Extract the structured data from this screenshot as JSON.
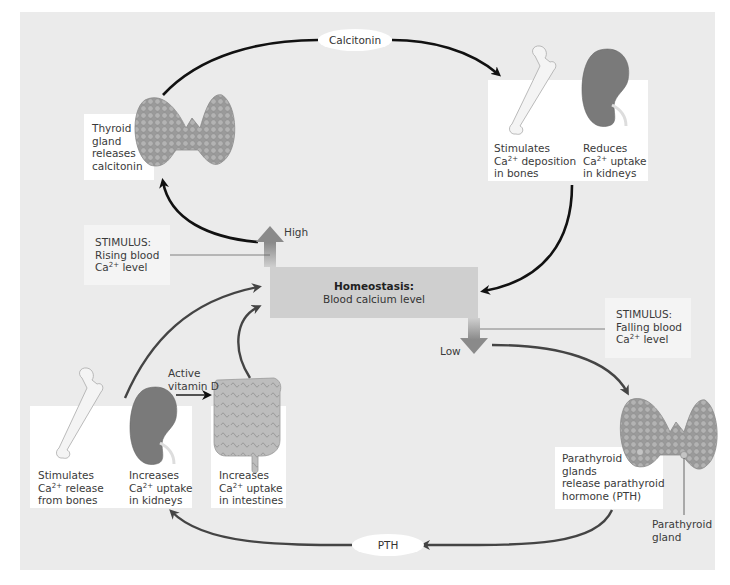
{
  "diagram": {
    "title": "Homeostasis: Blood calcium level",
    "center": {
      "title": "Homeostasis:",
      "subtitle": "Blood calcium level"
    },
    "high_label": "High",
    "low_label": "Low",
    "hormones": {
      "top": "Calcitonin",
      "bottom": "PTH"
    },
    "stimuli": {
      "rising": {
        "line1": "STIMULUS:",
        "line2": "Rising blood",
        "line3_prefix": "Ca",
        "line3_sup": "2+",
        "line3_suffix": " level"
      },
      "falling": {
        "line1": "STIMULUS:",
        "line2": "Falling blood",
        "line3_prefix": "Ca",
        "line3_sup": "2+",
        "line3_suffix": " level"
      }
    },
    "thyroid": {
      "line1": "Thyroid",
      "line2": "gland",
      "line3": "releases",
      "line4": "calcitonin"
    },
    "top_effects": [
      {
        "line1": "Stimulates",
        "line2_prefix": "Ca",
        "line2_sup": "2+",
        "line2_suffix": " deposition",
        "line3": "in bones"
      },
      {
        "line1": "Reduces",
        "line2_prefix": "Ca",
        "line2_sup": "2+",
        "line2_suffix": " uptake",
        "line3": "in kidneys"
      }
    ],
    "parathyroid": {
      "line1": "Parathyroid",
      "line2": "glands",
      "line3": "release parathyroid",
      "line4": "hormone (PTH)",
      "pointer_line1": "Parathyroid",
      "pointer_line2": "gland"
    },
    "vitamin_d": {
      "line1": "Active",
      "line2": "vitamin D"
    },
    "bottom_effects": [
      {
        "line1": "Stimulates",
        "line2_prefix": "Ca",
        "line2_sup": "2+",
        "line2_suffix": " release",
        "line3": "from bones"
      },
      {
        "line1": "Increases",
        "line2_prefix": "Ca",
        "line2_sup": "2+",
        "line2_suffix": " uptake",
        "line3": "in kidneys"
      },
      {
        "line1": "Increases",
        "line2_prefix": "Ca",
        "line2_sup": "2+",
        "line2_suffix": " uptake",
        "line3": "in intestines"
      }
    ],
    "colors": {
      "background": "#ebebeb",
      "center_box": "#cfcfcf",
      "arrow_gray": "#8a8a8a",
      "arrow_black": "#111111",
      "arrow_dark": "#444444",
      "thyroid": "#a8a8a8",
      "kidney": "#7a7a7a",
      "bone": "#f2f2f2"
    }
  }
}
